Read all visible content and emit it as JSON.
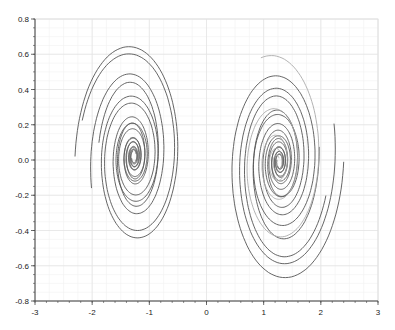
{
  "chart_data": {
    "type": "line",
    "title": "",
    "xlabel": "",
    "ylabel": "",
    "xlim": [
      -3,
      3
    ],
    "ylim": [
      -0.8,
      0.8
    ],
    "x_ticks": [
      -3,
      -2,
      -1,
      0,
      1,
      2,
      3
    ],
    "x_tick_labels": [
      "-3",
      "-2",
      "-1",
      "0",
      "1",
      "2",
      "3"
    ],
    "y_ticks": [
      0.8,
      0.6,
      0.4,
      0.2,
      0.0,
      -0.2,
      -0.4,
      -0.6,
      -0.8
    ],
    "y_tick_labels": [
      "0.8",
      "0.6",
      "0.4",
      "0.2",
      "0.0",
      "-0.2",
      "-0.4",
      "-0.6",
      "-0.8"
    ],
    "grid": true,
    "minor_grid": true,
    "legend": null,
    "series": [
      {
        "name": "trajectory-dark",
        "color": "#555555",
        "attractor_foci": [
          [
            -1.27,
            0.02
          ],
          [
            1.28,
            -0.01
          ]
        ],
        "left_lobe_extent": {
          "x": [
            -2.3,
            -0.05
          ],
          "y": [
            -0.75,
            0.68
          ]
        },
        "right_lobe_extent": {
          "x": [
            0.05,
            2.4
          ],
          "y": [
            -0.68,
            0.75
          ]
        }
      },
      {
        "name": "trajectory-light",
        "color": "#aaaaaa"
      }
    ]
  },
  "colors": {
    "axis": "#444444",
    "grid_major": "#e4e4e4",
    "grid_minor": "#f2f2f2",
    "background": "#ffffff"
  }
}
